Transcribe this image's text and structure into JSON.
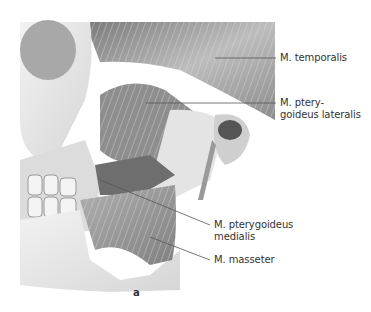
{
  "figure": {
    "panel_letter": "a",
    "labels": [
      {
        "text": "M. temporalis",
        "x": 280,
        "y": 52
      },
      {
        "text": "M. ptery-\ngoideus lateralis",
        "x": 280,
        "y": 98
      },
      {
        "text": "M. pterygoideus\nmedialis",
        "x": 214,
        "y": 219
      },
      {
        "text": "M. masseter",
        "x": 214,
        "y": 255
      }
    ],
    "colors": {
      "background": "#ffffff",
      "bone": "#e8e8e8",
      "muscle": "#9a9a9a",
      "dark_muscle": "#6a6a6a",
      "leader_line": "#555555",
      "text": "#333333"
    }
  }
}
